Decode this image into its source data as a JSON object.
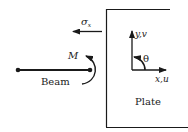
{
  "diagram": {
    "labels": {
      "stress": "σ",
      "stress_sub": "x",
      "moment": "M",
      "beam": "Beam",
      "plate": "Plate",
      "y_axis": "y,v",
      "x_axis": "x,u",
      "angle": "θ"
    },
    "colors": {
      "stroke": "#1a1a1a",
      "text": "#222222",
      "background": "#ffffff"
    }
  }
}
